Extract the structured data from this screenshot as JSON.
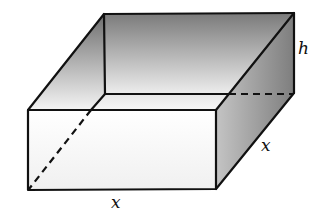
{
  "diagram": {
    "labels": {
      "height": "h",
      "depth": "x",
      "width": "x"
    },
    "colors": {
      "edge": "#111111",
      "front_face": "#ffffff",
      "shade_dark": "#7a7a7a",
      "shade_light": "#f2f2f2"
    }
  }
}
